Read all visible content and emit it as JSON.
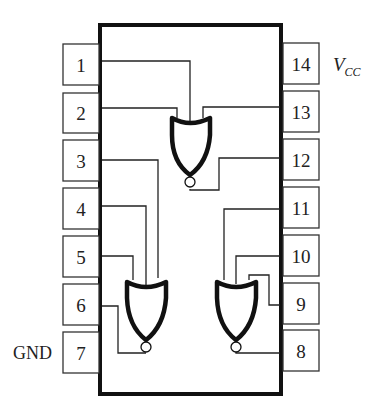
{
  "diagram": {
    "type": "14-pin DIP IC pinout with 3 NOR gates",
    "pins_left": [
      {
        "number": "1"
      },
      {
        "number": "2"
      },
      {
        "number": "3"
      },
      {
        "number": "4"
      },
      {
        "number": "5"
      },
      {
        "number": "6"
      },
      {
        "number": "7"
      }
    ],
    "pins_right": [
      {
        "number": "14"
      },
      {
        "number": "13"
      },
      {
        "number": "12"
      },
      {
        "number": "11"
      },
      {
        "number": "10"
      },
      {
        "number": "9"
      },
      {
        "number": "8"
      }
    ],
    "labels": {
      "vcc_main": "V",
      "vcc_sub": "CC",
      "gnd": "GND"
    },
    "gates": [
      {
        "name": "gate-top",
        "type": "NOR",
        "inputs": [
          "1",
          "2",
          "13"
        ],
        "output": "12"
      },
      {
        "name": "gate-bottom-left",
        "type": "NOR",
        "inputs": [
          "3",
          "4",
          "5"
        ],
        "output": "6"
      },
      {
        "name": "gate-bottom-right",
        "type": "NOR",
        "inputs": [
          "9",
          "10",
          "11"
        ],
        "output": "8"
      }
    ],
    "colors": {
      "line": "#111111",
      "box_border": "#333333",
      "text": "#222222",
      "background": "#ffffff"
    }
  }
}
